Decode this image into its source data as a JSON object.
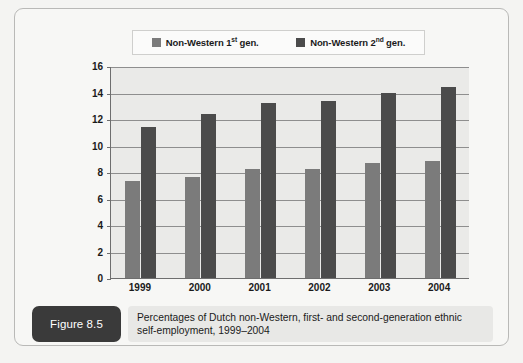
{
  "figure": {
    "badge_label": "Figure 8.5",
    "caption": "Percentages of Dutch non-Western, first- and second-generation ethnic self-employment, 1999–2004"
  },
  "legend": {
    "entries": [
      {
        "label_main": "Non-Western 1",
        "label_sup": "st",
        "label_tail": " gen.",
        "full": "Non-Western 1st gen.",
        "color": "#7b7b7b",
        "swatch_name": "legend-swatch-first-gen"
      },
      {
        "label_main": "Non-Western 2",
        "label_sup": "nd",
        "label_tail": " gen.",
        "full": "Non-Western 2nd gen.",
        "color": "#4b4b4b",
        "swatch_name": "legend-swatch-second-gen"
      }
    ]
  },
  "colors": {
    "series1": "#7b7b7b",
    "series2": "#4b4b4b",
    "plot_background": "#eaeae8",
    "gridline": "#8e8e8e",
    "axis": "#6e6e6e",
    "badge_background": "#3a3a3a",
    "caption_background": "#e8e8e6",
    "card_background": "#f7f7f5"
  },
  "chart_data": {
    "type": "bar",
    "title": "",
    "subtitle": "",
    "xlabel": "",
    "ylabel": "",
    "categories": [
      "1999",
      "2000",
      "2001",
      "2002",
      "2003",
      "2004"
    ],
    "series": [
      {
        "name": "Non-Western 1st gen.",
        "color": "#7b7b7b",
        "values": [
          7.3,
          7.6,
          8.2,
          8.25,
          8.65,
          8.8
        ]
      },
      {
        "name": "Non-Western 2nd gen.",
        "color": "#4b4b4b",
        "values": [
          11.4,
          12.35,
          13.2,
          13.35,
          14.0,
          14.4
        ]
      }
    ],
    "ylim": [
      0,
      16
    ],
    "ytick_step": 2,
    "yticks": [
      0,
      2,
      4,
      6,
      8,
      10,
      12,
      14,
      16
    ],
    "ytick_labels": [
      "0",
      "2",
      "4",
      "6",
      "8",
      "10",
      "12",
      "14",
      "16"
    ],
    "grid": true,
    "grid_axis": "y",
    "legend_position": "top"
  }
}
